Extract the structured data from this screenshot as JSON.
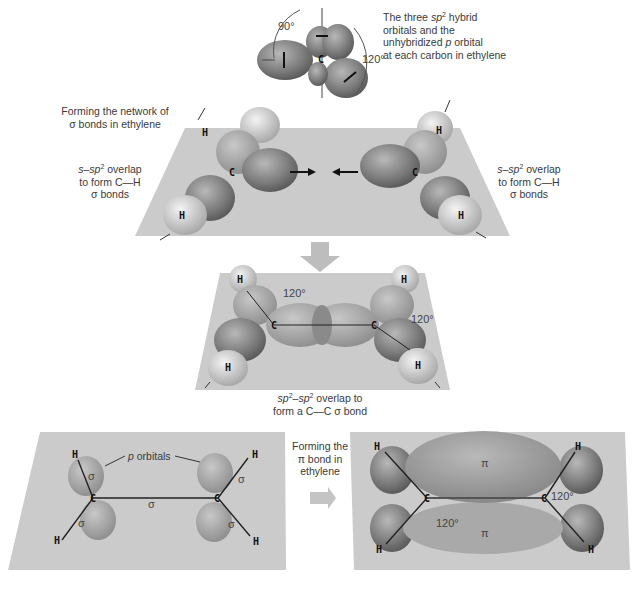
{
  "figure": {
    "top_caption": {
      "line1_pre": "The three ",
      "line1_sp": "sp",
      "line1_sup": "2",
      "line1_post": " hybrid",
      "line2": "orbitals and the",
      "line3_pre": "unhybridized ",
      "line3_p": "p",
      "line3_post": " orbital",
      "line4": "at each carbon in ethylene"
    },
    "top_angles": {
      "left": "90°",
      "right": "120°"
    },
    "top_orbital_labels": {
      "sp_label": "sp",
      "sup": "2",
      "p_label": "p",
      "carbon": "C"
    },
    "sigma_network_title": {
      "line1": "Forming the network of",
      "line2": "σ bonds in ethylene"
    },
    "s_sp2_overlap": {
      "pre": "s–sp",
      "sup": "2",
      "post": " overlap",
      "line2": "to form C—H",
      "line3": "σ bonds"
    },
    "approach_signs": {
      "minus": "–",
      "plus": "+"
    },
    "middle": {
      "angle_left": "120°",
      "angle_right": "120°",
      "caption_pre": "sp",
      "caption_sup1": "2",
      "caption_mid": "–sp",
      "caption_sup2": "2",
      "caption_post": " overlap to",
      "caption_line2": "form a C—C σ bond"
    },
    "bottom_left": {
      "p_orbitals_label": "p",
      "p_orbitals_label_rest": " orbitals",
      "sigma": "σ"
    },
    "pi_title": {
      "line1": "Forming the",
      "line2": "π bond in",
      "line3": "ethylene"
    },
    "bottom_right": {
      "pi": "π",
      "angle_left": "120°",
      "angle_right": "120°"
    },
    "atoms": {
      "H": "H",
      "C": "C"
    }
  },
  "colors": {
    "plane": "#c9c9c9",
    "orbital_dark": "#6e6e6e",
    "orbital_mid": "#9a9a9a",
    "orbital_light": "#bdbdbd",
    "hydrogen": "#d9d9d9",
    "arrow": "#bdbdbd",
    "line": "#222222"
  }
}
